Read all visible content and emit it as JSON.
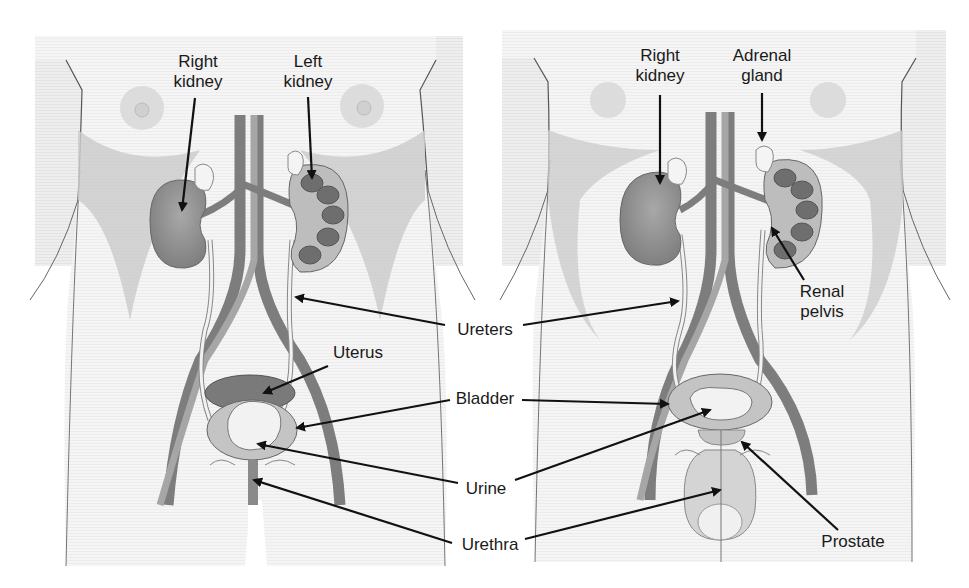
{
  "diagram": {
    "colors": {
      "panel_bg": "#ececec",
      "body_fill": "#f4f4f4",
      "shadow_fill": "#cfcfcf",
      "kidney": "#8a8a8a",
      "vessel_dark": "#7d7d7d",
      "vessel_light": "#a6a6a6",
      "bladder": "#c4c4c4",
      "urine": "#f2f2f2",
      "uterus": "#7a7a7a",
      "arrow": "#111111"
    },
    "panels": [
      {
        "name": "female",
        "labels": {
          "right_kidney_1": "Right",
          "right_kidney_2": "kidney",
          "left_kidney_1": "Left",
          "left_kidney_2": "kidney",
          "uterus": "Uterus"
        }
      },
      {
        "name": "male",
        "labels": {
          "right_kidney_1": "Right",
          "right_kidney_2": "kidney",
          "adrenal_1": "Adrenal",
          "adrenal_2": "gland",
          "renal_pelvis_1": "Renal",
          "renal_pelvis_2": "pelvis",
          "prostate": "Prostate"
        }
      }
    ],
    "shared_labels": {
      "ureters": "Ureters",
      "bladder": "Bladder",
      "urine": "Urine",
      "urethra": "Urethra"
    }
  }
}
